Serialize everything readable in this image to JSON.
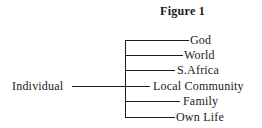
{
  "figure": {
    "title": "Figure 1",
    "root": "Individual",
    "branches": [
      {
        "label": "God"
      },
      {
        "label": "World"
      },
      {
        "label": "S.Africa"
      },
      {
        "label": "Local Community"
      },
      {
        "label": "Family"
      },
      {
        "label": "Own Life"
      }
    ]
  }
}
